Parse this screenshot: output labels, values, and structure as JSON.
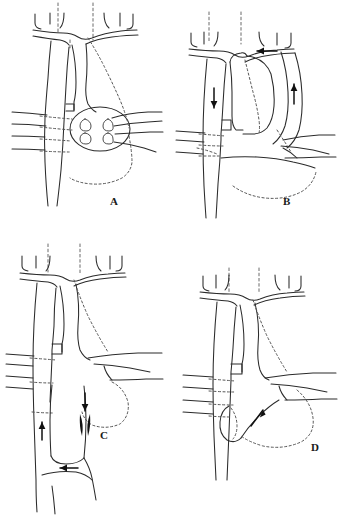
{
  "figure": {
    "background_color": "#ffffff",
    "line_color": "#2b2b2b",
    "dotted_line_color": "#5a5a5a",
    "arrow_color": "#111111",
    "width": 346,
    "height": 518,
    "layout": "2x2 grid of line drawings"
  },
  "panels": [
    {
      "id": "A",
      "label": "A",
      "label_x": 110,
      "label_y": 205,
      "description": "Aortic arch with great vessels; oval mediastinal outline with paired vessel stumps; horizontal intercostal vessels crossing descending aorta; dotted hidden contours",
      "arrows": []
    },
    {
      "id": "B",
      "label": "B",
      "label_x": 283,
      "label_y": 205,
      "description": "Arch with flow arrows indicating retrograde and antegrade collateral circulation",
      "arrows": [
        {
          "name": "leftward-arch-arrow",
          "direction": "left"
        },
        {
          "name": "descending-down-arrow",
          "direction": "down"
        },
        {
          "name": "right-ascending-up-arrow",
          "direction": "up"
        }
      ]
    },
    {
      "id": "C",
      "label": "C",
      "label_x": 100,
      "label_y": 439,
      "description": "Arch with lower loop, paired stenosis markers and circulating flow arrows",
      "arrows": [
        {
          "name": "left-limb-up-arrow",
          "direction": "up"
        },
        {
          "name": "right-limb-down-arrow",
          "direction": "down"
        },
        {
          "name": "bottom-leftward-arrow",
          "direction": "left"
        }
      ],
      "markers": [
        {
          "name": "stenosis-marker-left",
          "type": "filled-triangle"
        },
        {
          "name": "stenosis-marker-right",
          "type": "filled-triangle"
        }
      ]
    },
    {
      "id": "D",
      "label": "D",
      "label_x": 311,
      "label_y": 451,
      "description": "Arch with small residual loop near descending aorta and a single oblique flow arrow",
      "arrows": [
        {
          "name": "oblique-flow-arrow",
          "direction": "up-left"
        }
      ]
    }
  ]
}
